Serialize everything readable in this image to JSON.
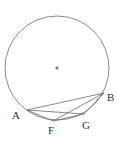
{
  "diagram": {
    "circle": {
      "cx": 57,
      "cy": 68,
      "r": 52,
      "stroke": "#8a8a8a"
    },
    "center": {
      "x": 57,
      "y": 68
    },
    "points": {
      "A": {
        "label": "A",
        "x": 27,
        "y": 110,
        "lx": 12,
        "ly": 119
      },
      "F": {
        "label": "F",
        "x": 53,
        "y": 121,
        "lx": 48,
        "ly": 134
      },
      "G": {
        "label": "G",
        "x": 84,
        "y": 114,
        "lx": 83,
        "ly": 129
      },
      "B": {
        "label": "B",
        "x": 104,
        "y": 93,
        "lx": 107,
        "ly": 101
      }
    },
    "segments": [
      [
        "A",
        "B"
      ],
      [
        "A",
        "G"
      ],
      [
        "A",
        "F"
      ],
      [
        "F",
        "B"
      ],
      [
        "F",
        "G"
      ],
      [
        "G",
        "B"
      ]
    ]
  }
}
